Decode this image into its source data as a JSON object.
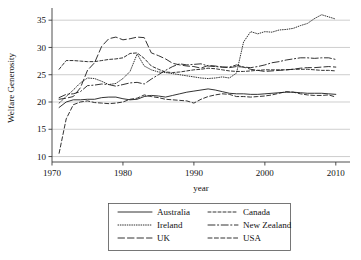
{
  "chart_data": {
    "type": "line",
    "title": "",
    "xlabel": "year",
    "ylabel": "Welfare Generosity",
    "xlim": [
      1970,
      2012
    ],
    "ylim": [
      9,
      36.5
    ],
    "xticks": [
      1970,
      1980,
      1990,
      2000,
      2010
    ],
    "yticks": [
      10,
      15,
      20,
      25,
      30,
      35
    ],
    "grid": "horizontal",
    "legend_position": "below-center",
    "legend_columns": 2,
    "x": [
      1971,
      1972,
      1973,
      1974,
      1975,
      1976,
      1977,
      1978,
      1979,
      1980,
      1981,
      1982,
      1983,
      1984,
      1985,
      1986,
      1987,
      1988,
      1989,
      1990,
      1991,
      1992,
      1993,
      1994,
      1995,
      1996,
      1997,
      1998,
      1999,
      2000,
      2001,
      2002,
      2003,
      2004,
      2005,
      2006,
      2007,
      2008,
      2009,
      2010
    ],
    "series": [
      {
        "name": "Australia",
        "dash": "solid",
        "values": [
          19.0,
          20.0,
          20.4,
          20.4,
          20.5,
          20.5,
          20.8,
          20.9,
          20.9,
          20.6,
          20.4,
          20.5,
          21.0,
          21.2,
          21.1,
          20.9,
          21.2,
          21.5,
          21.8,
          22.0,
          22.2,
          22.4,
          22.2,
          21.9,
          21.6,
          21.5,
          21.5,
          21.4,
          21.4,
          21.5,
          21.6,
          21.7,
          21.8,
          21.8,
          21.7,
          21.6,
          21.6,
          21.6,
          21.5,
          21.4
        ]
      },
      {
        "name": "Canada",
        "dash": "dashed-short",
        "values": [
          26.0,
          27.6,
          27.6,
          27.5,
          27.4,
          27.4,
          27.6,
          27.8,
          27.9,
          28.1,
          28.9,
          29.0,
          28.0,
          26.6,
          26.0,
          25.5,
          25.4,
          25.5,
          25.7,
          25.9,
          26.0,
          26.2,
          26.1,
          25.9,
          25.7,
          25.6,
          25.6,
          25.7,
          25.8,
          25.9,
          25.9,
          25.9,
          25.9,
          26.0,
          26.0,
          26.0,
          25.9,
          25.8,
          25.8,
          25.7
        ]
      },
      {
        "name": "Ireland",
        "dash": "dotted",
        "values": [
          19.8,
          21.0,
          22.2,
          23.5,
          24.4,
          24.3,
          23.8,
          23.2,
          23.4,
          24.3,
          25.6,
          28.8,
          26.6,
          25.9,
          25.5,
          25.4,
          25.2,
          25.0,
          24.8,
          24.6,
          24.4,
          24.3,
          24.4,
          24.6,
          24.4,
          25.3,
          31.0,
          32.9,
          32.5,
          32.9,
          32.8,
          33.2,
          33.3,
          33.5,
          34.0,
          34.4,
          35.3,
          36.0,
          35.6,
          35.2
        ]
      },
      {
        "name": "New Zealand",
        "dash": "dash-dot-long",
        "values": [
          20.8,
          21.4,
          21.5,
          21.9,
          23.0,
          23.1,
          23.3,
          23.2,
          22.9,
          23.2,
          23.5,
          23.6,
          23.3,
          24.2,
          25.0,
          25.8,
          26.5,
          27.0,
          26.8,
          26.9,
          27.0,
          26.6,
          26.5,
          26.4,
          26.4,
          26.8,
          26.4,
          26.3,
          26.5,
          26.8,
          27.2,
          27.4,
          27.7,
          27.9,
          28.1,
          28.1,
          28.0,
          28.1,
          28.1,
          27.8
        ]
      },
      {
        "name": "UK",
        "dash": "dashed-long",
        "values": [
          20.5,
          20.7,
          21.0,
          22.6,
          25.8,
          27.2,
          30.2,
          31.6,
          31.9,
          31.4,
          31.6,
          31.9,
          31.8,
          29.0,
          28.5,
          27.9,
          27.1,
          26.8,
          26.6,
          26.5,
          26.2,
          26.7,
          26.6,
          26.4,
          26.3,
          26.5,
          26.4,
          26.0,
          25.8,
          25.6,
          25.7,
          25.8,
          25.9,
          26.0,
          26.2,
          26.3,
          26.3,
          26.4,
          26.5,
          26.4
        ]
      },
      {
        "name": "USA",
        "dash": "dashed-medium",
        "values": [
          10.6,
          16.9,
          19.5,
          20.0,
          20.2,
          19.9,
          19.8,
          19.7,
          19.8,
          20.0,
          20.5,
          20.7,
          21.3,
          21.0,
          20.8,
          20.5,
          20.4,
          20.3,
          20.2,
          19.8,
          20.5,
          21.0,
          21.3,
          21.5,
          21.4,
          21.0,
          21.0,
          20.9,
          21.0,
          21.1,
          21.3,
          21.6,
          21.9,
          21.8,
          21.5,
          21.3,
          21.2,
          21.2,
          21.3,
          20.9
        ]
      }
    ]
  },
  "axes": {
    "y_title": "Welfare Generosity",
    "x_title": "year",
    "y_tick_labels": [
      "35",
      "30",
      "25",
      "20",
      "15",
      "10"
    ],
    "x_tick_labels": [
      "1970",
      "1980",
      "1990",
      "2000",
      "2010"
    ]
  },
  "legend": {
    "entries": [
      {
        "label": "Australia",
        "dash": "solid"
      },
      {
        "label": "Canada",
        "dash": "dashed-short"
      },
      {
        "label": "Ireland",
        "dash": "dotted"
      },
      {
        "label": "New Zealand",
        "dash": "dash-dot-long"
      },
      {
        "label": "UK",
        "dash": "dashed-long"
      },
      {
        "label": "USA",
        "dash": "dashed-medium"
      }
    ]
  },
  "colors": {
    "line": "#1c1c1c",
    "grid": "#b9b9b9",
    "axis": "#3a3a3a",
    "text": "#111111",
    "background": "#ffffff"
  }
}
